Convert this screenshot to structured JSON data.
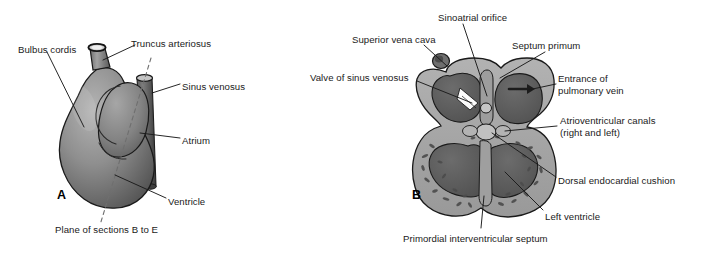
{
  "figure": {
    "background_color": "#ffffff",
    "text_color": "#1a1a1a",
    "panels": [
      {
        "id": "A",
        "letter": "A",
        "caption": "External view of primordial heart tube",
        "letter_pos": {
          "x": 57,
          "y": 188
        }
      },
      {
        "id": "B",
        "letter": "B",
        "caption": "Coronal section of primordial heart",
        "letter_pos": {
          "x": 412,
          "y": 188
        }
      }
    ],
    "labels_panel_a": [
      {
        "name": "bulbus-cordis",
        "text": "Bulbus cordis",
        "x": 18,
        "y": 44
      },
      {
        "name": "truncus-arteriosus",
        "text": "Truncus arteriosus",
        "x": 131,
        "y": 38
      },
      {
        "name": "sinus-venosus",
        "text": "Sinus venosus",
        "x": 182,
        "y": 81
      },
      {
        "name": "atrium",
        "text": "Atrium",
        "x": 182,
        "y": 135
      },
      {
        "name": "ventricle",
        "text": "Ventricle",
        "x": 168,
        "y": 196
      },
      {
        "name": "plane-of-sections",
        "text": "Plane of sections B to E",
        "x": 55,
        "y": 224
      }
    ],
    "labels_panel_b": [
      {
        "name": "sinoatrial-orifice",
        "text": "Sinoatrial orifice",
        "x": 438,
        "y": 12
      },
      {
        "name": "superior-vena-cava",
        "text": "Superior vena cava",
        "x": 352,
        "y": 34
      },
      {
        "name": "septum-primum",
        "text": "Septum primum",
        "x": 512,
        "y": 40
      },
      {
        "name": "valve-of-sinus-venosus",
        "text": "Valve of sinus venosus",
        "x": 310,
        "y": 72
      },
      {
        "name": "entrance-of-pulmonary-vein",
        "text": "Entrance of\npulmonary vein",
        "x": 558,
        "y": 73
      },
      {
        "name": "atrioventricular-canals",
        "text": "Atrioventricular canals\n(right and left)",
        "x": 560,
        "y": 115
      },
      {
        "name": "dorsal-endocardial-cushion",
        "text": "Dorsal endocardial cushion",
        "x": 558,
        "y": 175
      },
      {
        "name": "left-ventricle",
        "text": "Left ventricle",
        "x": 545,
        "y": 211
      },
      {
        "name": "primordial-interventricular-septum",
        "text": "Primordial interventricular septum",
        "x": 403,
        "y": 233
      }
    ],
    "colors": {
      "outline": "#1a1a1a",
      "myocardium_light": "#a9a9a9",
      "myocardium_mid": "#8d8d8d",
      "chamber_dark": "#5e5e5e",
      "chamber_darker": "#4a4a4a",
      "tube_dark": "#4f4f4f",
      "lumen_light": "#c9c9c9",
      "highlight": "#f2f2f2",
      "leader_line": "#1a1a1a",
      "dashed_plane": "#777777"
    }
  }
}
